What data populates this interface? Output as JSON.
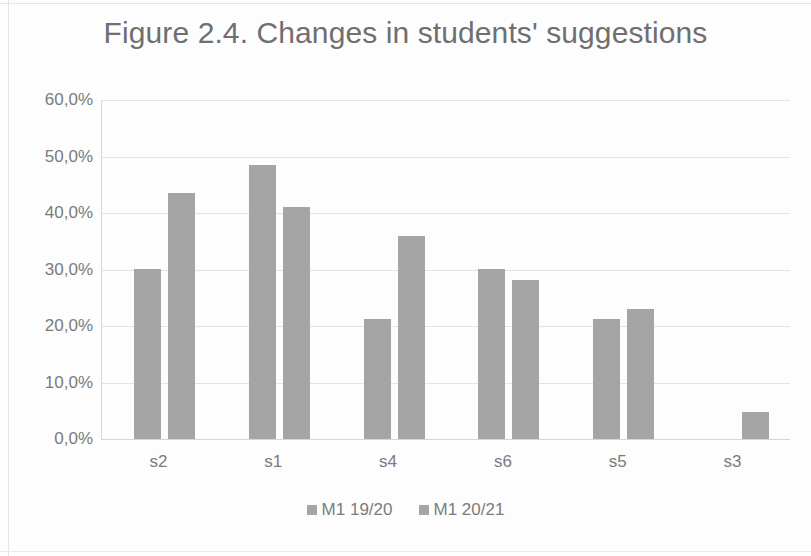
{
  "chart_data": {
    "type": "bar",
    "title": "Figure 2.4. Changes in students' suggestions",
    "xlabel": "",
    "ylabel": "",
    "ylim": [
      0,
      60
    ],
    "ytick_labels": [
      "60,0%",
      "50,0%",
      "40,0%",
      "30,0%",
      "20,0%",
      "10,0%",
      "0,0%"
    ],
    "ytick_values": [
      60,
      50,
      40,
      30,
      20,
      10,
      0
    ],
    "grid": true,
    "legend_position": "bottom",
    "categories": [
      "s2",
      "s1",
      "s4",
      "s6",
      "s5",
      "s3"
    ],
    "series": [
      {
        "name": "M1 19/20",
        "color": "#a5a5a5",
        "values": [
          30.1,
          48.5,
          21.2,
          30.1,
          21.2,
          0.0
        ]
      },
      {
        "name": "M1 20/21",
        "color": "#a5a5a5",
        "values": [
          43.5,
          41.0,
          35.9,
          28.1,
          23.0,
          4.8
        ]
      }
    ]
  },
  "colors": {
    "bar": "#a5a5a5",
    "grid": "#e3e3e3",
    "text": "#7b7b7b",
    "title": "#6f6f6f",
    "background": "#fdfdfd"
  }
}
